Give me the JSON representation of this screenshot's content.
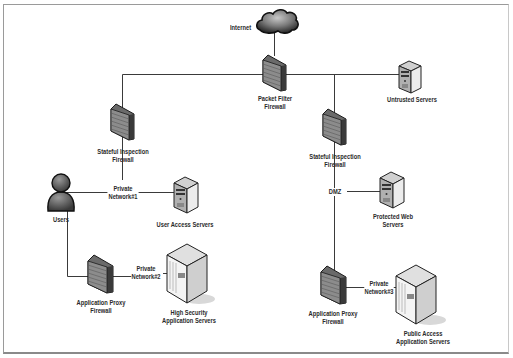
{
  "diagram": {
    "type": "network-topology",
    "colors": {
      "line": "#3a3a3a",
      "frame": "#9a9a9a",
      "device_dark": "#4a4a4a",
      "device_light": "#d8d8d8",
      "background": "#ffffff"
    },
    "nodes": [
      {
        "id": "internet",
        "icon": "cloud-icon",
        "label": [
          "Internet"
        ]
      },
      {
        "id": "packet-filter-firewall",
        "icon": "firewall-icon",
        "label": [
          "Packet Filter",
          "Firewall"
        ]
      },
      {
        "id": "untrusted-servers",
        "icon": "server-icon",
        "label": [
          "Untrusted Servers"
        ]
      },
      {
        "id": "stateful-firewall-1",
        "icon": "firewall-icon",
        "label": [
          "Stateful Inspection",
          "Firewall"
        ]
      },
      {
        "id": "stateful-firewall-2",
        "icon": "firewall-icon",
        "label": [
          "Stateful Inspection",
          "Firewall"
        ]
      },
      {
        "id": "users",
        "icon": "user-icon",
        "label": [
          "Users"
        ]
      },
      {
        "id": "user-access-servers",
        "icon": "server-icon",
        "label": [
          "User Access Servers"
        ]
      },
      {
        "id": "protected-web-servers",
        "icon": "server-icon",
        "label": [
          "Protected Web",
          "Servers"
        ]
      },
      {
        "id": "app-proxy-firewall-1",
        "icon": "firewall-icon",
        "label": [
          "Application Proxy",
          "Firewall"
        ]
      },
      {
        "id": "high-security-app-servers",
        "icon": "server-rack-icon",
        "label": [
          "High Security",
          "Application Servers"
        ]
      },
      {
        "id": "app-proxy-firewall-2",
        "icon": "firewall-icon",
        "label": [
          "Application Proxy",
          "Firewall"
        ]
      },
      {
        "id": "public-access-app-servers",
        "icon": "server-rack-icon",
        "label": [
          "Public Access",
          "Application Servers"
        ]
      }
    ],
    "network_labels": [
      {
        "id": "private-network-1",
        "label": [
          "Private",
          "Network#1"
        ]
      },
      {
        "id": "private-network-2",
        "label": [
          "Private",
          "Network#2"
        ]
      },
      {
        "id": "dmz",
        "label": [
          "DMZ"
        ]
      },
      {
        "id": "private-network-3",
        "label": [
          "Private",
          "Network#3"
        ]
      }
    ],
    "edges": [
      [
        "internet",
        "packet-filter-firewall"
      ],
      [
        "packet-filter-firewall",
        "untrusted-servers"
      ],
      [
        "packet-filter-firewall",
        "stateful-firewall-1"
      ],
      [
        "packet-filter-firewall",
        "stateful-firewall-2"
      ],
      [
        "stateful-firewall-1",
        "private-network-1"
      ],
      [
        "users",
        "private-network-1"
      ],
      [
        "private-network-1",
        "user-access-servers"
      ],
      [
        "users",
        "app-proxy-firewall-1"
      ],
      [
        "app-proxy-firewall-1",
        "private-network-2"
      ],
      [
        "private-network-2",
        "high-security-app-servers"
      ],
      [
        "stateful-firewall-2",
        "dmz"
      ],
      [
        "dmz",
        "protected-web-servers"
      ],
      [
        "dmz",
        "app-proxy-firewall-2"
      ],
      [
        "app-proxy-firewall-2",
        "private-network-3"
      ],
      [
        "private-network-3",
        "public-access-app-servers"
      ]
    ]
  }
}
